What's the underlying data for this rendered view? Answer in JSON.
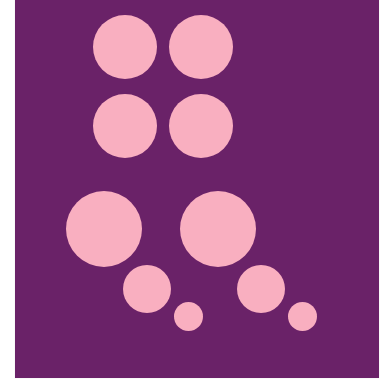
{
  "image": {
    "background_color": "#FFFFFF",
    "panel_color": "#6A2268",
    "dot_color": "#F9AFC0",
    "panel": {
      "x": 15,
      "y": 0,
      "width": 364,
      "height": 378
    }
  },
  "dots": [
    {
      "id": "top-left",
      "cx": 125,
      "cy": 47,
      "d": 64
    },
    {
      "id": "top-right",
      "cx": 201,
      "cy": 47,
      "d": 64
    },
    {
      "id": "second-left",
      "cx": 125,
      "cy": 126,
      "d": 64
    },
    {
      "id": "second-right",
      "cx": 201,
      "cy": 126,
      "d": 64
    },
    {
      "id": "large-left",
      "cx": 104,
      "cy": 229,
      "d": 76
    },
    {
      "id": "large-right",
      "cx": 218,
      "cy": 229,
      "d": 76
    },
    {
      "id": "medium-left",
      "cx": 147,
      "cy": 289,
      "d": 48
    },
    {
      "id": "medium-right",
      "cx": 261,
      "cy": 289,
      "d": 48
    },
    {
      "id": "small-left",
      "cx": 188,
      "cy": 316,
      "d": 29
    },
    {
      "id": "small-right",
      "cx": 302,
      "cy": 316,
      "d": 29
    }
  ]
}
